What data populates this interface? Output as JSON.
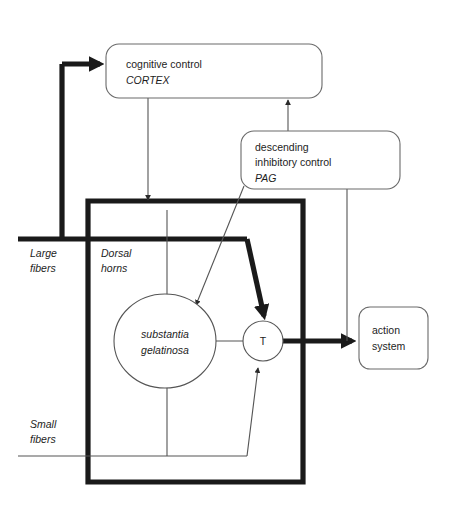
{
  "diagram": {
    "nodes": {
      "cortex": {
        "line1": "cognitive control",
        "line2": "CORTEX"
      },
      "pag": {
        "line1": "descending",
        "line2": "inhibitory control",
        "line3": "PAG"
      },
      "action": {
        "line1": "action",
        "line2": "system"
      },
      "substantia": {
        "line1": "substantia",
        "line2": "gelatinosa"
      },
      "transmission": {
        "label": "T"
      }
    },
    "labels": {
      "large_fibers_line1": "Large",
      "large_fibers_line2": "fibers",
      "small_fibers_line1": "Small",
      "small_fibers_line2": "fibers",
      "dorsal_horns_line1": "Dorsal",
      "dorsal_horns_line2": "horns"
    },
    "colors": {
      "background": "#ffffff",
      "thick_stroke": "#1a1a1a",
      "thin_stroke": "#555555",
      "box_stroke": "#6a6a6a",
      "text": "#1d1d1d"
    }
  }
}
